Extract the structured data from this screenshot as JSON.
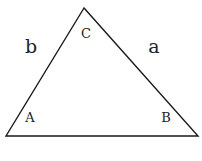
{
  "diagram": {
    "type": "triangle",
    "vertices": {
      "top": "C",
      "bottom_left": "A",
      "bottom_right": "B"
    },
    "sides": {
      "left": "b",
      "right": "a"
    }
  },
  "colors": {
    "stroke": "#1a1a1a",
    "text": "#222222"
  }
}
